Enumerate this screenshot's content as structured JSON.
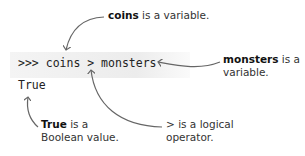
{
  "code": {
    "prompt": ">>>",
    "expression": "coins > monsters",
    "output": "True"
  },
  "annotations": [
    {
      "id": "coins",
      "term": "coins",
      "text": " is a variable."
    },
    {
      "id": "monsters",
      "term": "monsters",
      "text": " is a",
      "line2": "variable."
    },
    {
      "id": "true",
      "term": "True",
      "text": " is a",
      "line2": "Boolean value."
    },
    {
      "id": "operator",
      "term": "",
      "text": "> is a logical",
      "line2": "operator."
    }
  ],
  "colors": {
    "arrow": "#666666",
    "text": "#333333",
    "code_bg": "#efefef"
  }
}
